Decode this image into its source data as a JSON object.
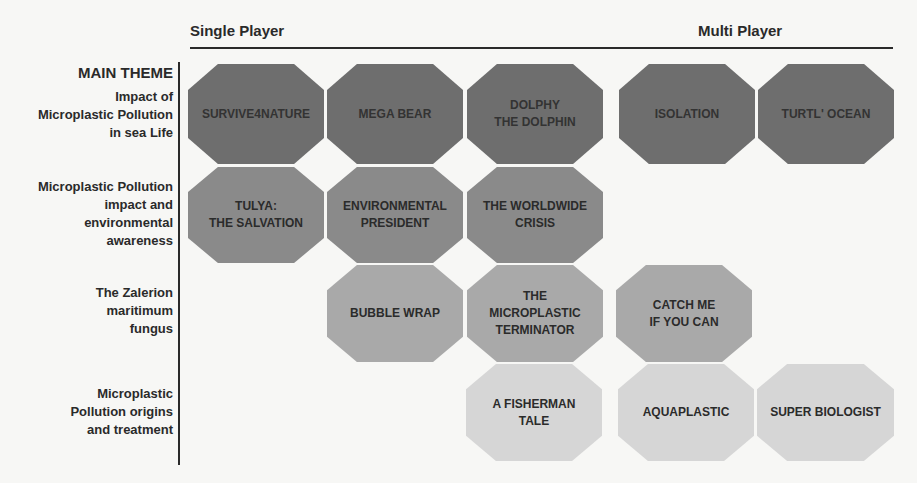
{
  "headers": {
    "single_player": "Single Player",
    "multi_player": "Multi Player",
    "main_theme": "MAIN THEME"
  },
  "rows": [
    {
      "label": "Impact of\nMicroplastic Pollution\nin sea Life",
      "tone": "darkest",
      "color": "#6e6e6e"
    },
    {
      "label": "Microplastic Pollution\nimpact and\nenvironmental\nawareness",
      "tone": "dark",
      "color": "#8a8a8a"
    },
    {
      "label": "The Zalerion\nmaritimum\nfungus",
      "tone": "medium",
      "color": "#a9a9a9"
    },
    {
      "label": "Microplastic\nPollution origins\nand treatment",
      "tone": "light",
      "color": "#d6d6d6"
    }
  ],
  "games": [
    {
      "title": "SURVIVE4NATURE",
      "row": 1,
      "category": "Single Player"
    },
    {
      "title": "MEGA BEAR",
      "row": 1,
      "category": "Single Player"
    },
    {
      "title": "DOLPHY\nTHE DOLPHIN",
      "row": 1,
      "category": "Single Player"
    },
    {
      "title": "ISOLATION",
      "row": 1,
      "category": "Multi Player"
    },
    {
      "title": "TURTL' OCEAN",
      "row": 1,
      "category": "Multi Player"
    },
    {
      "title": "TULYA:\nTHE SALVATION",
      "row": 2,
      "category": "Single Player"
    },
    {
      "title": "ENVIRONMENTAL\nPRESIDENT",
      "row": 2,
      "category": "Single Player"
    },
    {
      "title": "THE WORLDWIDE\nCRISIS",
      "row": 2,
      "category": "Single Player"
    },
    {
      "title": "BUBBLE WRAP",
      "row": 3,
      "category": "Single Player"
    },
    {
      "title": "THE\nMICROPLASTIC\nTERMINATOR",
      "row": 3,
      "category": "Single Player"
    },
    {
      "title": "CATCH ME\nIF YOU CAN",
      "row": 3,
      "category": "Multi Player"
    },
    {
      "title": "A FISHERMAN\nTALE",
      "row": 4,
      "category": "Single Player"
    },
    {
      "title": "AQUAPLASTIC",
      "row": 4,
      "category": "Multi Player"
    },
    {
      "title": "SUPER BIOLOGIST",
      "row": 4,
      "category": "Multi Player"
    }
  ]
}
